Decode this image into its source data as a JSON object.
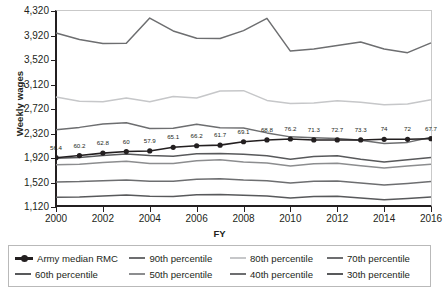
{
  "chart_data": {
    "type": "line",
    "title": "",
    "xlabel": "FY",
    "ylabel": "Weekly wages",
    "x": [
      2000,
      2001,
      2002,
      2003,
      2004,
      2005,
      2006,
      2007,
      2008,
      2009,
      2010,
      2011,
      2012,
      2013,
      2014,
      2015,
      2016
    ],
    "xticklabels": [
      "2000",
      "2002",
      "2004",
      "2006",
      "2008",
      "2010",
      "2012",
      "2014",
      "2016"
    ],
    "yticklabels": [
      "1,120",
      "1,520",
      "1,920",
      "2,320",
      "2,720",
      "3,120",
      "3,520",
      "3,920",
      "4,320"
    ],
    "ylim": [
      1120,
      4320
    ],
    "xlim": [
      2000,
      2016
    ],
    "grid": false,
    "legend_position": "bottom",
    "point_labels": [
      "56.4",
      "60.2",
      "62.8",
      "60",
      "57.9",
      "65.1",
      "66.2",
      "61.7",
      "69.1",
      "68.8",
      "76.2",
      "71.3",
      "72.7",
      "73.3",
      "74",
      "72",
      "67.7"
    ],
    "series": [
      {
        "name": "Army median RMC",
        "color": "#231f20",
        "width": 1.6,
        "markers": true,
        "values": [
          1925,
          1960,
          2000,
          2025,
          2035,
          2095,
          2120,
          2130,
          2185,
          2215,
          2230,
          2215,
          2215,
          2215,
          2225,
          2225,
          2235
        ]
      },
      {
        "name": "90th percentile",
        "color": "#6d6e70",
        "width": 1.5,
        "markers": false,
        "values": [
          3960,
          3855,
          3790,
          3795,
          4205,
          3995,
          3875,
          3870,
          4000,
          4200,
          3665,
          3700,
          3755,
          3815,
          3700,
          3640,
          3800
        ]
      },
      {
        "name": "80th percentile",
        "color": "#c6c7c9",
        "width": 1.5,
        "markers": false,
        "values": [
          2915,
          2845,
          2840,
          2900,
          2840,
          2925,
          2900,
          3015,
          3020,
          2860,
          2810,
          2820,
          2855,
          2830,
          2790,
          2800,
          2870
        ]
      },
      {
        "name": "70th percentile",
        "color": "#6d6e70",
        "width": 1.5,
        "markers": false,
        "values": [
          2380,
          2420,
          2475,
          2495,
          2400,
          2405,
          2470,
          2415,
          2410,
          2330,
          2265,
          2250,
          2240,
          2210,
          2155,
          2175,
          2260
        ]
      },
      {
        "name": "60th percentile",
        "color": "#58595b",
        "width": 1.5,
        "markers": false,
        "values": [
          1915,
          1930,
          1960,
          1985,
          1960,
          1950,
          1990,
          1995,
          1980,
          1955,
          1900,
          1945,
          1955,
          1900,
          1855,
          1890,
          1930
        ]
      },
      {
        "name": "50th percentile",
        "color": "#8c8d8f",
        "width": 1.5,
        "markers": false,
        "values": [
          1810,
          1820,
          1845,
          1865,
          1830,
          1830,
          1875,
          1890,
          1855,
          1840,
          1790,
          1825,
          1835,
          1795,
          1755,
          1790,
          1820
        ]
      },
      {
        "name": "40th percentile",
        "color": "#6d6e70",
        "width": 1.5,
        "markers": false,
        "values": [
          1530,
          1535,
          1550,
          1560,
          1540,
          1540,
          1575,
          1580,
          1560,
          1550,
          1510,
          1540,
          1545,
          1510,
          1480,
          1505,
          1535
        ]
      },
      {
        "name": "30th percentile",
        "color": "#58595b",
        "width": 1.5,
        "markers": false,
        "values": [
          1280,
          1285,
          1300,
          1315,
          1295,
          1290,
          1320,
          1325,
          1310,
          1300,
          1265,
          1290,
          1295,
          1265,
          1240,
          1260,
          1285
        ]
      }
    ]
  },
  "axis": {
    "y_title": "Weekly wages",
    "x_title": "FY"
  },
  "legend": {
    "row1": [
      {
        "label": "Army median RMC",
        "color": "#231f20",
        "marker": true
      },
      {
        "label": "90th percentile",
        "color": "#6d6e70",
        "marker": false
      },
      {
        "label": "80th percentile",
        "color": "#c6c7c9",
        "marker": false
      },
      {
        "label": "70th percentile",
        "color": "#6d6e70",
        "marker": false
      }
    ],
    "row2": [
      {
        "label": "60th percentile",
        "color": "#58595b",
        "marker": false
      },
      {
        "label": "50th percentile",
        "color": "#8c8d8f",
        "marker": false
      },
      {
        "label": "40th percentile",
        "color": "#6d6e70",
        "marker": false
      },
      {
        "label": "30th percentile",
        "color": "#58595b",
        "marker": false
      }
    ]
  }
}
